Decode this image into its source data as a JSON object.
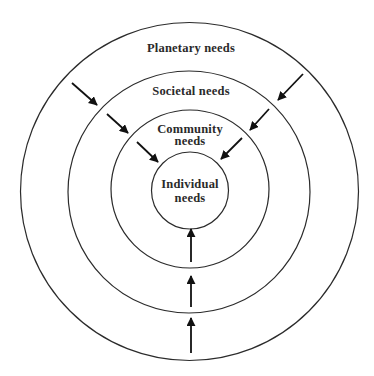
{
  "diagram": {
    "type": "concentric-circles",
    "center": [
      190,
      190
    ],
    "rings": [
      {
        "id": "planetary",
        "label_lines": [
          "Planetary needs"
        ],
        "radius": 169
      },
      {
        "id": "societal",
        "label_lines": [
          "Societal needs"
        ],
        "radius": 121
      },
      {
        "id": "community",
        "label_lines": [
          "Community",
          "needs"
        ],
        "radius": 79
      },
      {
        "id": "individual",
        "label_lines": [
          "Individual",
          "needs"
        ],
        "radius": 38
      }
    ],
    "labels": {
      "planetary": "Planetary needs",
      "societal": "Societal needs",
      "community_1": "Community",
      "community_2": "needs",
      "individual_1": "Individual",
      "individual_2": "needs"
    },
    "arrows": {
      "direction": "inward",
      "count": 9,
      "groups": [
        "upper-left diagonal",
        "upper-right diagonal",
        "bottom vertical"
      ]
    },
    "colors": {
      "line": "#2b2b2b",
      "text": "#2a2a2a",
      "background": "#ffffff"
    }
  }
}
